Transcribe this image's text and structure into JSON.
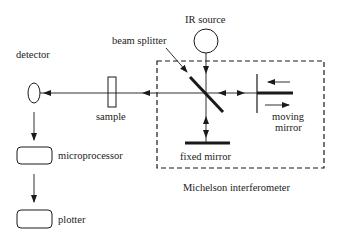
{
  "diagram": {
    "labels": {
      "ir_source": "IR source",
      "beam_splitter": "beam splitter",
      "detector": "detector",
      "sample": "sample",
      "moving_mirror_line1": "moving",
      "moving_mirror_line2": "mirror",
      "fixed_mirror": "fixed mirror",
      "interferometer": "Michelson interferometer",
      "microprocessor": "microprocessor",
      "plotter": "plotter"
    },
    "colors": {
      "line": "#1a1a1a",
      "background": "#ffffff"
    }
  }
}
